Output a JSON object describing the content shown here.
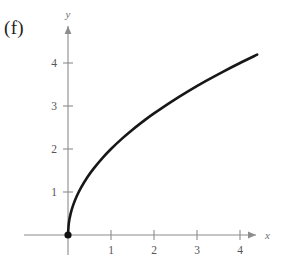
{
  "figure": {
    "part_label": "(f)",
    "background_color": "#ffffff",
    "axis_color": "#8c8c8c",
    "curve_color": "#171717",
    "label_color": "#1d1d1d"
  },
  "chart_data": {
    "type": "line",
    "title": "",
    "subtitle": "",
    "xlabel": "x",
    "ylabel": "y",
    "function": "y = 2*sqrt(x)",
    "grid": false,
    "legend": false,
    "xlim": [
      -0.45,
      5.0
    ],
    "ylim": [
      -0.6,
      5.1
    ],
    "x_ticks": [
      1,
      2,
      3,
      4
    ],
    "x_tick_labels": [
      "1",
      "2",
      "3",
      "4"
    ],
    "y_ticks": [
      1,
      2,
      3,
      4
    ],
    "y_tick_labels": [
      "1",
      "2",
      "3",
      "4"
    ],
    "origin_marker": {
      "x": 0,
      "y": 0,
      "style": "filled-circle",
      "color": "#111111"
    },
    "series": [
      {
        "name": "y = 2√x",
        "color": "#171717",
        "x": [
          0,
          0.02,
          0.06,
          0.12,
          0.2,
          0.3,
          0.45,
          0.6,
          0.8,
          1.0,
          1.25,
          1.5,
          1.8,
          2.0,
          2.4,
          2.8,
          3.2,
          3.6,
          4.0,
          4.4
        ],
        "y": [
          0,
          0.283,
          0.49,
          0.693,
          0.894,
          1.095,
          1.342,
          1.549,
          1.789,
          2.0,
          2.236,
          2.449,
          2.683,
          2.828,
          3.098,
          3.347,
          3.578,
          3.795,
          4.0,
          4.195
        ]
      }
    ]
  },
  "axes": {
    "x_axis_name": "x",
    "y_axis_name": "y"
  }
}
